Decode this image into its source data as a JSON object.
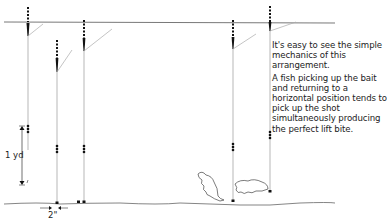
{
  "caption": {
    "paragraph_1": "It's easy to see the simple mechanics of this arrangement.",
    "paragraph_2": "A fish picking up the bait and returning to a horizontal position tends to pick up the shot simultaneously producing the perfect lift bite."
  },
  "labels": {
    "depth": "1 yd",
    "gap": "2\""
  },
  "colors": {
    "line": "#8a8a8a",
    "ink": "#1a1a1a"
  }
}
